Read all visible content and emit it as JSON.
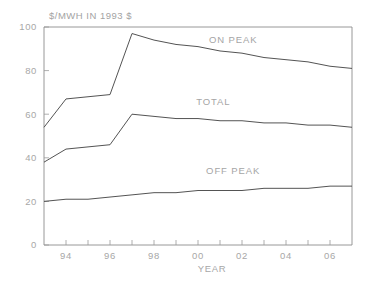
{
  "chart_data": {
    "type": "line",
    "title": "$/MWH IN 1993 $",
    "xlabel": "YEAR",
    "ylabel": "",
    "xlim": [
      1993,
      2007
    ],
    "ylim": [
      0,
      100
    ],
    "grid": false,
    "legend_position": "inline-annotations",
    "x": [
      1993,
      1994,
      1995,
      1996,
      1997,
      1998,
      1999,
      2000,
      2001,
      2002,
      2003,
      2004,
      2005,
      2006,
      2007
    ],
    "xtick_labels": [
      "94",
      "96",
      "98",
      "00",
      "02",
      "04",
      "06"
    ],
    "xtick_values": [
      1994,
      1996,
      1998,
      2000,
      2002,
      2004,
      2006
    ],
    "ytick_labels": [
      "0",
      "20",
      "40",
      "60",
      "80",
      "100"
    ],
    "ytick_values": [
      0,
      20,
      40,
      60,
      80,
      100
    ],
    "series": [
      {
        "name": "ON PEAK",
        "label": "ON PEAK",
        "color": "#4a4a4a",
        "values": [
          54,
          67,
          68,
          69,
          97,
          94,
          92,
          91,
          89,
          88,
          86,
          85,
          84,
          82,
          81
        ]
      },
      {
        "name": "TOTAL",
        "label": "TOTAL",
        "color": "#4a4a4a",
        "values": [
          38,
          44,
          45,
          46,
          60,
          59,
          58,
          58,
          57,
          57,
          56,
          56,
          55,
          55,
          54
        ]
      },
      {
        "name": "OFF PEAK",
        "label": "OFF PEAK",
        "color": "#4a4a4a",
        "values": [
          20,
          21,
          21,
          22,
          23,
          24,
          24,
          25,
          25,
          25,
          26,
          26,
          26,
          27,
          27
        ]
      }
    ],
    "annotations": [
      {
        "text": "ON PEAK",
        "x": 2001.6,
        "y": 92.5
      },
      {
        "text": "TOTAL",
        "x": 2000.7,
        "y": 64.0
      },
      {
        "text": "OFF PEAK",
        "x": 2001.6,
        "y": 32.5
      }
    ]
  }
}
